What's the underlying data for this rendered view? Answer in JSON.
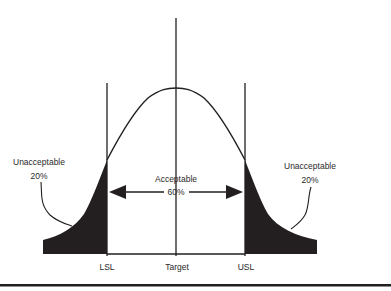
{
  "diagram": {
    "type": "normal-distribution-specification-limits",
    "labels": {
      "left_tail": {
        "title": "Unacceptable",
        "percent": "20%"
      },
      "center": {
        "title": "Acceptable",
        "percent": "60%"
      },
      "right_tail": {
        "title": "Unacceptable",
        "percent": "20%"
      }
    },
    "axis_labels": {
      "lsl": "LSL",
      "target": "Target",
      "usl": "USL"
    },
    "colors": {
      "ink": "#231f20",
      "fill": "#231f20",
      "background": "#ffffff"
    }
  }
}
